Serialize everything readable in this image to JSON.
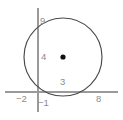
{
  "figure": {
    "type": "geometry-diagram",
    "canvas": {
      "width": 123,
      "height": 120,
      "background": "#ffffff"
    },
    "colors": {
      "axis": "#9a9a9a",
      "circle": "#4a4a4a",
      "center_dot": "#111111",
      "label_text": "#8c8c8c"
    },
    "axes": {
      "x_axis": {
        "y": 92,
        "x_start": 5,
        "x_end": 118
      },
      "y_axis": {
        "x": 38,
        "y_start": 8,
        "y_end": 112
      }
    },
    "circle": {
      "center": {
        "x": 63,
        "y": 57
      },
      "radius": 39,
      "center_dot_radius": 2.6
    },
    "labels": [
      {
        "name": "y-top",
        "text": "9",
        "axis": "y",
        "value": 9
      },
      {
        "name": "y-mid",
        "text": "4",
        "axis": "y",
        "value": 4
      },
      {
        "name": "x-mid",
        "text": "3",
        "axis": "x",
        "value": 3
      },
      {
        "name": "x-left",
        "text": "−2",
        "axis": "x",
        "value": -2
      },
      {
        "name": "x-origin",
        "text": "−1",
        "axis": "x",
        "value": -1
      },
      {
        "name": "x-right",
        "text": "8",
        "axis": "x",
        "value": 8
      }
    ]
  },
  "chart_data": {
    "type": "scatter",
    "title": "",
    "xlabel": "",
    "ylabel": "",
    "grid": false,
    "legend": null,
    "xlim": [
      -2,
      8
    ],
    "ylim": [
      -1,
      9
    ],
    "xticks": [
      -2,
      -1,
      8
    ],
    "xticklabels": [
      "−2",
      "−1",
      "8"
    ],
    "yticks": [
      4,
      9
    ],
    "yticklabels": [
      "4",
      "9"
    ],
    "annotations": [
      "3"
    ],
    "shapes": [
      {
        "kind": "circle",
        "center": [
          3,
          4.5
        ],
        "radius": 4.5,
        "stroke": "#4a4a4a",
        "fill": "none"
      },
      {
        "kind": "point",
        "label": "center",
        "x": 3,
        "y": 4.5,
        "color": "#111111"
      }
    ]
  }
}
